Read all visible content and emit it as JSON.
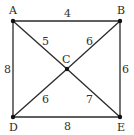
{
  "diagram": {
    "type": "weighted-graph",
    "nodes": [
      {
        "id": "A",
        "label": "A",
        "x": 13,
        "y": 21,
        "lx": 9,
        "ly": 14
      },
      {
        "id": "B",
        "label": "B",
        "x": 120,
        "y": 21,
        "lx": 117,
        "ly": 14
      },
      {
        "id": "C",
        "label": "C",
        "x": 67,
        "y": 69,
        "lx": 62,
        "ly": 63
      },
      {
        "id": "D",
        "label": "D",
        "x": 13,
        "y": 117,
        "lx": 9,
        "ly": 131
      },
      {
        "id": "E",
        "label": "E",
        "x": 120,
        "y": 117,
        "lx": 117,
        "ly": 131
      }
    ],
    "edges": [
      {
        "from": "A",
        "to": "B",
        "weight": "4",
        "lx": 64,
        "ly": 17
      },
      {
        "from": "A",
        "to": "D",
        "weight": "8",
        "lx": 4,
        "ly": 73
      },
      {
        "from": "B",
        "to": "E",
        "weight": "6",
        "lx": 122,
        "ly": 73
      },
      {
        "from": "D",
        "to": "E",
        "weight": "8",
        "lx": 64,
        "ly": 130
      },
      {
        "from": "A",
        "to": "C",
        "weight": "5",
        "lx": 42,
        "ly": 45
      },
      {
        "from": "B",
        "to": "C",
        "weight": "6",
        "lx": 86,
        "ly": 45
      },
      {
        "from": "D",
        "to": "C",
        "weight": "6",
        "lx": 42,
        "ly": 103
      },
      {
        "from": "E",
        "to": "C",
        "weight": "7",
        "lx": 86,
        "ly": 103
      }
    ]
  }
}
